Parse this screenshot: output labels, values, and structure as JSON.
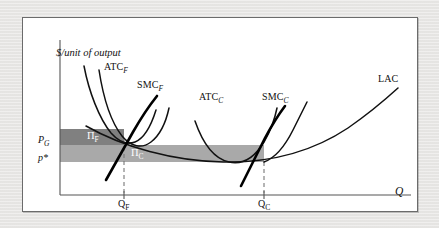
{
  "figure": {
    "type": "economics-cost-curve-diagram",
    "axes": {
      "y_label": "$/unit of output",
      "x_label": "Q"
    },
    "price_lines": [
      {
        "id": "pg",
        "label_main": "P",
        "label_sub": "G",
        "y_px": 143
      },
      {
        "id": "pstar",
        "label_main": "p*",
        "label_sub": "",
        "y_px": 160
      }
    ],
    "quantity_ticks": [
      {
        "id": "qf",
        "label_main": "Q",
        "label_sub": "F",
        "x_px": 123
      },
      {
        "id": "qc",
        "label_main": "Q",
        "label_sub": "C",
        "x_px": 263
      }
    ],
    "curves": [
      {
        "id": "atc-f",
        "label_main": "ATC",
        "label_sub": "F",
        "label_x": 103,
        "label_y": 67
      },
      {
        "id": "smc-f",
        "label_main": "SMC",
        "label_sub": "F",
        "label_x": 136,
        "label_y": 84
      },
      {
        "id": "atc-c",
        "label_main": "ATC",
        "label_sub": "C",
        "label_x": 198,
        "label_y": 96
      },
      {
        "id": "smc-c",
        "label_main": "SMC",
        "label_sub": "C",
        "label_x": 261,
        "label_y": 96
      },
      {
        "id": "lac",
        "label_main": "LAC",
        "label_sub": "",
        "label_x": 377,
        "label_y": 78
      }
    ],
    "regions": [
      {
        "id": "profit-fringe",
        "label_main": "Π",
        "label_sub": "F",
        "label_x": 86,
        "label_y": 130,
        "color": "#808080",
        "x": 60,
        "y": 128,
        "width": 64,
        "height": 16
      },
      {
        "id": "profit-core",
        "label_main": "Π",
        "label_sub": "C",
        "label_x": 130,
        "label_y": 147,
        "color": "#a9a9a9",
        "x": 60,
        "y": 144,
        "width": 204,
        "height": 17
      }
    ],
    "colors": {
      "panel_background": "#ffffff",
      "page_background": "#e8e7e5",
      "panel_border": "#6b6b6b",
      "axis": "#555555",
      "curve_thin": "#1a1a1a",
      "curve_thick": "#000000",
      "dark_band": "#808080",
      "light_band": "#a9a9a9",
      "dashed_guide": "#777777"
    }
  }
}
